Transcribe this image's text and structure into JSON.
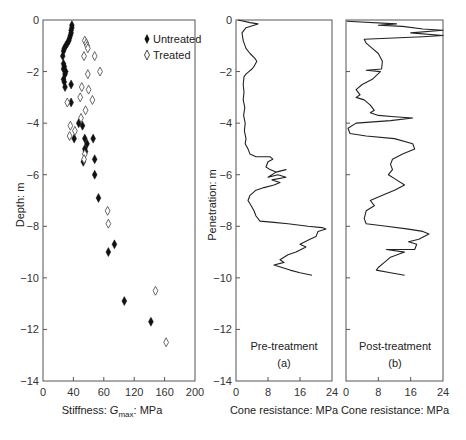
{
  "chart_data": [
    {
      "type": "scatter",
      "title": "",
      "xlabel": "Stiffness: G_max: MPa",
      "xlabel_main": "Stiffness: ",
      "xlabel_italic": "G",
      "xlabel_sub": "max",
      "xlabel_tail": ": MPa",
      "ylabel": "Depth: m",
      "xlim": [
        0,
        200
      ],
      "ylim": [
        -14,
        0
      ],
      "xticks": [
        "0",
        "40",
        "60",
        "120",
        "160",
        "200"
      ],
      "yticks": [
        "0",
        "-2",
        "-4",
        "-6",
        "-8",
        "-10",
        "-12",
        "-14"
      ],
      "legend_position": "upper right",
      "series": [
        {
          "name": "Untreated",
          "marker": "filled-diamond",
          "points": [
            [
              38,
              -0.2
            ],
            [
              38,
              -0.3
            ],
            [
              37,
              -0.4
            ],
            [
              37,
              -0.5
            ],
            [
              36,
              -0.6
            ],
            [
              35,
              -0.7
            ],
            [
              34,
              -0.8
            ],
            [
              32,
              -0.9
            ],
            [
              30,
              -1.0
            ],
            [
              28,
              -1.1
            ],
            [
              27,
              -1.2
            ],
            [
              26,
              -1.4
            ],
            [
              27,
              -1.7
            ],
            [
              28,
              -1.8
            ],
            [
              27,
              -1.9
            ],
            [
              30,
              -2.0
            ],
            [
              29,
              -2.1
            ],
            [
              27,
              -2.3
            ],
            [
              28,
              -2.4
            ],
            [
              29,
              -2.6
            ],
            [
              37,
              -2.5
            ],
            [
              37,
              -3.2
            ],
            [
              47,
              -4.0
            ],
            [
              52,
              -4.1
            ],
            [
              41,
              -4.6
            ],
            [
              55,
              -4.6
            ],
            [
              58,
              -4.8
            ],
            [
              66,
              -4.6
            ],
            [
              55,
              -5.0
            ],
            [
              56,
              -5.1
            ],
            [
              53,
              -5.5
            ],
            [
              68,
              -5.4
            ],
            [
              68,
              -6.0
            ],
            [
              73,
              -6.9
            ],
            [
              94,
              -8.7
            ],
            [
              86,
              -9.0
            ],
            [
              107,
              -10.9
            ],
            [
              142,
              -11.7
            ]
          ]
        },
        {
          "name": "Treated",
          "marker": "open-diamond",
          "points": [
            [
              55,
              -0.8
            ],
            [
              57,
              -0.9
            ],
            [
              58,
              -1.0
            ],
            [
              59,
              -1.1
            ],
            [
              54,
              -1.4
            ],
            [
              68,
              -1.4
            ],
            [
              75,
              -2.0
            ],
            [
              59,
              -2.1
            ],
            [
              51,
              -2.6
            ],
            [
              60,
              -2.7
            ],
            [
              49,
              -3.0
            ],
            [
              65,
              -3.1
            ],
            [
              32,
              -3.2
            ],
            [
              56,
              -3.5
            ],
            [
              50,
              -3.8
            ],
            [
              36,
              -4.1
            ],
            [
              42,
              -4.3
            ],
            [
              35,
              -4.5
            ],
            [
              55,
              -5.2
            ],
            [
              54,
              -5.4
            ],
            [
              85,
              -7.4
            ],
            [
              86,
              -7.9
            ],
            [
              148,
              -10.5
            ],
            [
              162,
              -12.5
            ]
          ]
        }
      ]
    },
    {
      "type": "line",
      "title": "Pre-treatment",
      "panel_label": "(a)",
      "xlabel": "Cone resistance: MPa",
      "ylabel": "Penetration: m",
      "xlim": [
        0,
        24
      ],
      "ylim": [
        -14,
        0
      ],
      "xticks": [
        "0",
        "8",
        "16",
        "24"
      ],
      "yticks": [
        "0",
        "-2",
        "-4",
        "-6",
        "-8",
        "-10",
        "-12",
        "-14"
      ],
      "series": [
        {
          "name": "Pre-treatment",
          "points": [
            [
              0.5,
              0.0
            ],
            [
              3.5,
              -0.1
            ],
            [
              5.5,
              -0.15
            ],
            [
              2.5,
              -0.3
            ],
            [
              1.5,
              -0.5
            ],
            [
              1.8,
              -0.8
            ],
            [
              2.5,
              -1.1
            ],
            [
              3.5,
              -1.3
            ],
            [
              4.8,
              -1.5
            ],
            [
              5.2,
              -1.6
            ],
            [
              4.5,
              -1.8
            ],
            [
              4.0,
              -1.9
            ],
            [
              3.2,
              -2.0
            ],
            [
              2.5,
              -2.1
            ],
            [
              2.0,
              -2.2
            ],
            [
              1.8,
              -2.5
            ],
            [
              2.0,
              -2.8
            ],
            [
              1.8,
              -3.1
            ],
            [
              2.2,
              -3.4
            ],
            [
              1.9,
              -3.7
            ],
            [
              2.3,
              -4.0
            ],
            [
              2.1,
              -4.3
            ],
            [
              2.5,
              -4.6
            ],
            [
              2.3,
              -4.8
            ],
            [
              3.0,
              -5.0
            ],
            [
              3.5,
              -5.2
            ],
            [
              5.0,
              -5.3
            ],
            [
              8.5,
              -5.3
            ],
            [
              9.2,
              -5.4
            ],
            [
              8.0,
              -5.5
            ],
            [
              7.5,
              -5.7
            ],
            [
              8.5,
              -5.8
            ],
            [
              10.0,
              -5.9
            ],
            [
              12.5,
              -5.8
            ],
            [
              10.0,
              -5.9
            ],
            [
              8.0,
              -6.1
            ],
            [
              10.5,
              -6.0
            ],
            [
              12.5,
              -6.1
            ],
            [
              9.0,
              -6.2
            ],
            [
              11.0,
              -6.3
            ],
            [
              9.5,
              -6.4
            ],
            [
              7.0,
              -6.5
            ],
            [
              5.0,
              -6.6
            ],
            [
              3.5,
              -6.8
            ],
            [
              3.0,
              -7.0
            ],
            [
              3.8,
              -7.2
            ],
            [
              4.5,
              -7.4
            ],
            [
              5.0,
              -7.6
            ],
            [
              6.0,
              -7.8
            ],
            [
              9.5,
              -7.85
            ],
            [
              13.0,
              -7.9
            ],
            [
              18.0,
              -8.0
            ],
            [
              21.5,
              -8.05
            ],
            [
              22.5,
              -8.1
            ],
            [
              20.5,
              -8.2
            ],
            [
              20.0,
              -8.4
            ],
            [
              18.5,
              -8.5
            ],
            [
              16.0,
              -8.7
            ],
            [
              17.5,
              -8.8
            ],
            [
              15.0,
              -9.0
            ],
            [
              13.0,
              -9.1
            ],
            [
              11.0,
              -9.3
            ],
            [
              12.0,
              -9.4
            ],
            [
              9.5,
              -9.5
            ],
            [
              11.5,
              -9.6
            ],
            [
              13.5,
              -9.7
            ],
            [
              16.0,
              -9.8
            ],
            [
              19.0,
              -9.9
            ]
          ]
        }
      ]
    },
    {
      "type": "line",
      "title": "Post-treatment",
      "panel_label": "(b)",
      "xlabel": "Cone resistance: MPa",
      "ylabel": "",
      "xlim": [
        0,
        24
      ],
      "ylim": [
        -14,
        0
      ],
      "xticks": [
        "0",
        "8",
        "16",
        "24"
      ],
      "series": [
        {
          "name": "Post-treatment",
          "points": [
            [
              0.2,
              -0.05
            ],
            [
              12.5,
              -0.15
            ],
            [
              8.0,
              -0.2
            ],
            [
              14.0,
              -0.25
            ],
            [
              19.0,
              -0.35
            ],
            [
              24.0,
              -0.4
            ],
            [
              16.0,
              -0.5
            ],
            [
              24.0,
              -0.6
            ],
            [
              19.0,
              -0.65
            ],
            [
              4.5,
              -0.75
            ],
            [
              5.0,
              -0.9
            ],
            [
              6.5,
              -1.1
            ],
            [
              8.0,
              -1.3
            ],
            [
              9.0,
              -1.6
            ],
            [
              8.8,
              -1.9
            ],
            [
              5.0,
              -1.95
            ],
            [
              8.5,
              -2.0
            ],
            [
              6.5,
              -2.3
            ],
            [
              4.0,
              -2.5
            ],
            [
              2.5,
              -2.7
            ],
            [
              3.5,
              -2.9
            ],
            [
              2.5,
              -3.0
            ],
            [
              4.5,
              -3.1
            ],
            [
              6.0,
              -3.3
            ],
            [
              7.0,
              -3.5
            ],
            [
              6.0,
              -3.6
            ],
            [
              8.0,
              -3.7
            ],
            [
              12.0,
              -3.75
            ],
            [
              16.5,
              -3.8
            ],
            [
              11.0,
              -3.9
            ],
            [
              2.5,
              -4.0
            ],
            [
              0.5,
              -4.2
            ],
            [
              1.0,
              -4.4
            ],
            [
              5.0,
              -4.5
            ],
            [
              12.0,
              -4.6
            ],
            [
              16.5,
              -4.8
            ],
            [
              17.0,
              -5.0
            ],
            [
              14.0,
              -5.2
            ],
            [
              11.5,
              -5.4
            ],
            [
              11.0,
              -5.6
            ],
            [
              11.5,
              -5.8
            ],
            [
              10.5,
              -6.0
            ],
            [
              12.5,
              -6.2
            ],
            [
              14.5,
              -6.4
            ],
            [
              12.0,
              -6.6
            ],
            [
              9.0,
              -6.8
            ],
            [
              6.0,
              -7.0
            ],
            [
              7.0,
              -7.2
            ],
            [
              5.0,
              -7.4
            ],
            [
              4.5,
              -7.7
            ],
            [
              5.0,
              -7.9
            ],
            [
              10.0,
              -8.0
            ],
            [
              15.0,
              -8.1
            ],
            [
              19.0,
              -8.2
            ],
            [
              20.5,
              -8.3
            ],
            [
              18.0,
              -8.5
            ],
            [
              15.5,
              -8.6
            ],
            [
              17.5,
              -8.7
            ],
            [
              17.0,
              -8.9
            ],
            [
              10.0,
              -8.9
            ],
            [
              14.5,
              -9.0
            ],
            [
              11.0,
              -9.2
            ],
            [
              9.5,
              -9.4
            ],
            [
              8.0,
              -9.6
            ],
            [
              7.5,
              -9.7
            ],
            [
              11.0,
              -9.8
            ],
            [
              14.5,
              -9.9
            ]
          ]
        }
      ]
    }
  ],
  "panels": {
    "left": {
      "ylabel": "Depth: m",
      "xlabel_pre": "Stiffness: ",
      "xlabel_g": "G",
      "xlabel_sub": "max",
      "xlabel_post": ": MPa",
      "legend": {
        "untreated": "Untreated",
        "treated": "Treated"
      }
    },
    "middle": {
      "ylabel": "Penetration: m",
      "xlabel": "Cone resistance: MPa",
      "caption": "Pre-treatment",
      "label": "(a)"
    },
    "right": {
      "xlabel": "Cone resistance: MPa",
      "caption": "Post-treatment",
      "label": "(b)"
    }
  }
}
